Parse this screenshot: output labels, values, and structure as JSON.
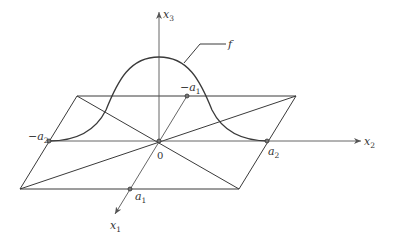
{
  "diagram": {
    "axes": {
      "x1": {
        "label": "x",
        "subscript": "1"
      },
      "x2": {
        "label": "x",
        "subscript": "2"
      },
      "x3": {
        "label": "x",
        "subscript": "3"
      }
    },
    "origin_label": "0",
    "function_label": "f",
    "points": {
      "neg_a1": {
        "prefix": "−a",
        "subscript": "1"
      },
      "a1": {
        "prefix": "a",
        "subscript": "1"
      },
      "neg_a2": {
        "prefix": "−a",
        "subscript": "2"
      },
      "a2": {
        "prefix": "a",
        "subscript": "2"
      }
    },
    "colors": {
      "line": "#3a3a3a",
      "text": "#333333",
      "background": "#ffffff"
    }
  }
}
